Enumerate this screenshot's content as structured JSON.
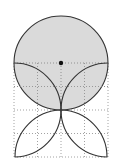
{
  "diagram": {
    "type": "geometry-figure",
    "grid": {
      "columns": 4,
      "rows": 4,
      "cell_size": 23,
      "origin_x": 14,
      "origin_y": 63,
      "line_style": "dotted",
      "line_color": "#888888"
    },
    "circle": {
      "cx": 61,
      "cy": 63,
      "r": 46,
      "fill": "#d3d3d3",
      "stroke": "#333333"
    },
    "center_point": {
      "cx": 61,
      "cy": 63,
      "r": 2.2,
      "fill": "#111111"
    },
    "arcs_color": "#333333"
  }
}
